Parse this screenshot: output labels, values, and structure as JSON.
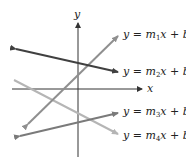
{
  "axes": {
    "x_label": "x",
    "y_label": "y"
  },
  "lines": [
    {
      "id": "line-1",
      "label_y": "y",
      "label_eq": "=",
      "m": "m",
      "m_sub": "1",
      "x": "x",
      "plus": "+",
      "b": "b",
      "b_sub": "1",
      "color": "#8f8f8f",
      "slope": "positive"
    },
    {
      "id": "line-2",
      "label_y": "y",
      "label_eq": "=",
      "m": "m",
      "m_sub": "2",
      "x": "x",
      "plus": "+",
      "b": "b",
      "b_sub": "2",
      "color": "#404040",
      "slope": "negative"
    },
    {
      "id": "line-3",
      "label_y": "y",
      "label_eq": "=",
      "m": "m",
      "m_sub": "3",
      "x": "x",
      "plus": "+",
      "b": "b",
      "b_sub": "3",
      "color": "#7a7a7a",
      "slope": "positive"
    },
    {
      "id": "line-4",
      "label_y": "y",
      "label_eq": "=",
      "m": "m",
      "m_sub": "4",
      "x": "x",
      "plus": "+",
      "b": "b",
      "b_sub": "4",
      "color": "#b5b5b5",
      "slope": "negative"
    }
  ]
}
